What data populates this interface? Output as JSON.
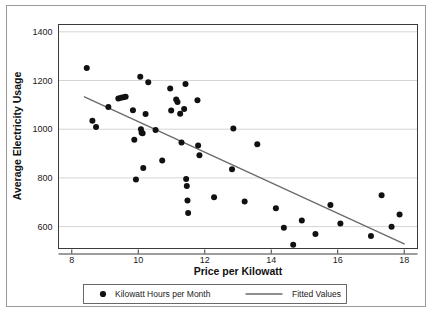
{
  "chart_data": {
    "type": "scatter",
    "title": "",
    "xlabel": "Price per Kilowatt",
    "ylabel": "Average Electricity Usage",
    "xlim": [
      7.6,
      18.4
    ],
    "ylim": [
      510,
      1430
    ],
    "xticks": [
      8,
      10,
      12,
      14,
      16,
      18
    ],
    "yticks": [
      600,
      800,
      1000,
      1200,
      1400
    ],
    "xtick_labels": [
      "8",
      "10",
      "12",
      "14",
      "16",
      "18"
    ],
    "ytick_labels": [
      "600",
      "800",
      "1000",
      "1200",
      "1400"
    ],
    "grid": "horizontal",
    "legend_position": "below-axes",
    "series": [
      {
        "name": "Kilowatt Hours per Month",
        "type": "scatter",
        "marker": "circle",
        "color": "#111111",
        "points": [
          [
            8.45,
            1251
          ],
          [
            8.62,
            1035
          ],
          [
            8.73,
            1009
          ],
          [
            9.1,
            1091
          ],
          [
            9.4,
            1126
          ],
          [
            9.48,
            1129
          ],
          [
            9.55,
            1131
          ],
          [
            9.62,
            1133
          ],
          [
            9.84,
            1078
          ],
          [
            9.88,
            957
          ],
          [
            9.93,
            793
          ],
          [
            10.06,
            1215
          ],
          [
            10.08,
            1000
          ],
          [
            10.1,
            985
          ],
          [
            10.13,
            983
          ],
          [
            10.15,
            841
          ],
          [
            10.22,
            1062
          ],
          [
            10.3,
            1193
          ],
          [
            10.52,
            997
          ],
          [
            10.72,
            871
          ],
          [
            10.96,
            1167
          ],
          [
            10.99,
            1077
          ],
          [
            11.14,
            1122
          ],
          [
            11.18,
            1112
          ],
          [
            11.26,
            1063
          ],
          [
            11.3,
            945
          ],
          [
            11.38,
            1083
          ],
          [
            11.42,
            1186
          ],
          [
            11.44,
            795
          ],
          [
            11.46,
            767
          ],
          [
            11.48,
            707
          ],
          [
            11.5,
            656
          ],
          [
            11.78,
            1119
          ],
          [
            11.8,
            933
          ],
          [
            11.84,
            893
          ],
          [
            12.28,
            721
          ],
          [
            12.82,
            836
          ],
          [
            12.86,
            1003
          ],
          [
            13.2,
            703
          ],
          [
            13.58,
            938
          ],
          [
            14.14,
            675
          ],
          [
            14.38,
            595
          ],
          [
            14.66,
            525
          ],
          [
            14.92,
            625
          ],
          [
            15.33,
            570
          ],
          [
            15.78,
            689
          ],
          [
            16.08,
            613
          ],
          [
            17.0,
            561
          ],
          [
            17.32,
            729
          ],
          [
            17.62,
            599
          ],
          [
            17.86,
            650
          ]
        ]
      },
      {
        "name": "Fitted Values",
        "type": "line",
        "color": "#6b6b6b",
        "endpoints": [
          [
            8.38,
            1133
          ],
          [
            18.0,
            529
          ]
        ],
        "slope": -62.8,
        "intercept": 1659
      }
    ],
    "legend": [
      {
        "label": "Kilowatt Hours per Month",
        "marker": "circle",
        "color": "#111111"
      },
      {
        "label": "Fitted Values",
        "marker": "line",
        "color": "#6b6b6b"
      }
    ]
  }
}
